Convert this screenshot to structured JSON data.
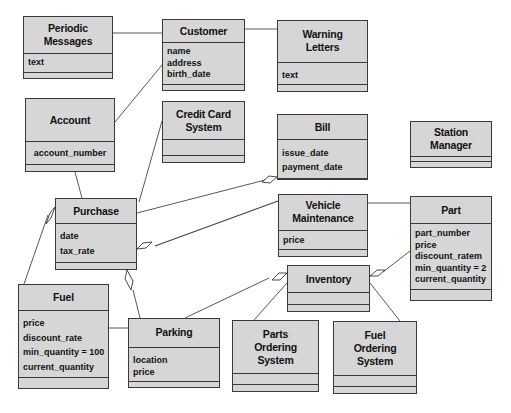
{
  "diagram": {
    "type": "UML class diagram",
    "classes": [
      {
        "id": "periodic_messages",
        "name": "Periodic\nMessages",
        "attributes": [
          "text"
        ]
      },
      {
        "id": "customer",
        "name": "Customer",
        "attributes": [
          "name",
          "address",
          "birth_date"
        ]
      },
      {
        "id": "warning_letters",
        "name": "Warning\nLetters",
        "attributes": [
          "text"
        ]
      },
      {
        "id": "account",
        "name": "Account",
        "attributes": [
          "account_number"
        ]
      },
      {
        "id": "credit_card_system",
        "name": "Credit Card\nSystem",
        "attributes": []
      },
      {
        "id": "bill",
        "name": "Bill",
        "attributes": [
          "issue_date",
          "payment_date"
        ]
      },
      {
        "id": "station_manager",
        "name": "Station\nManager",
        "attributes": []
      },
      {
        "id": "purchase",
        "name": "Purchase",
        "attributes": [
          "date",
          "tax_rate"
        ]
      },
      {
        "id": "vehicle_maintenance",
        "name": "Vehicle\nMaintenance",
        "attributes": [
          "price"
        ]
      },
      {
        "id": "part",
        "name": "Part",
        "attributes": [
          "part_number",
          "price",
          "discount_ratem",
          "min_quantity = 2",
          "current_quantity"
        ]
      },
      {
        "id": "inventory",
        "name": "Inventory",
        "attributes": []
      },
      {
        "id": "fuel",
        "name": "Fuel",
        "attributes": [
          "price",
          "discount_rate",
          "min_quantity = 100",
          "current_quantity"
        ]
      },
      {
        "id": "parking",
        "name": "Parking",
        "attributes": [
          "location",
          "price"
        ]
      },
      {
        "id": "parts_ordering_system",
        "name": "Parts\nOrdering\nSystem",
        "attributes": []
      },
      {
        "id": "fuel_ordering_system",
        "name": "Fuel\nOrdering\nSystem",
        "attributes": []
      }
    ],
    "relationships": [
      {
        "from": "periodic_messages",
        "to": "customer",
        "type": "association"
      },
      {
        "from": "customer",
        "to": "warning_letters",
        "type": "association"
      },
      {
        "from": "account",
        "to": "customer",
        "type": "association"
      },
      {
        "from": "account",
        "to": "purchase",
        "type": "association"
      },
      {
        "from": "credit_card_system",
        "to": "purchase",
        "type": "association"
      },
      {
        "from": "purchase",
        "to": "bill",
        "type": "aggregation",
        "diamond_at": "bill"
      },
      {
        "from": "vehicle_maintenance",
        "to": "purchase",
        "type": "aggregation",
        "diamond_at": "purchase"
      },
      {
        "from": "fuel",
        "to": "purchase",
        "type": "aggregation",
        "diamond_at": "purchase"
      },
      {
        "from": "parking",
        "to": "purchase",
        "type": "aggregation",
        "diamond_at": "purchase"
      },
      {
        "from": "fuel",
        "to": "parking",
        "type": "association"
      },
      {
        "from": "vehicle_maintenance",
        "to": "part",
        "type": "association"
      },
      {
        "from": "part",
        "to": "inventory",
        "type": "aggregation",
        "diamond_at": "inventory"
      },
      {
        "from": "parking",
        "to": "inventory",
        "type": "aggregation",
        "diamond_at": "inventory"
      },
      {
        "from": "inventory",
        "to": "parts_ordering_system",
        "type": "association"
      },
      {
        "from": "inventory",
        "to": "fuel_ordering_system",
        "type": "association"
      }
    ]
  }
}
